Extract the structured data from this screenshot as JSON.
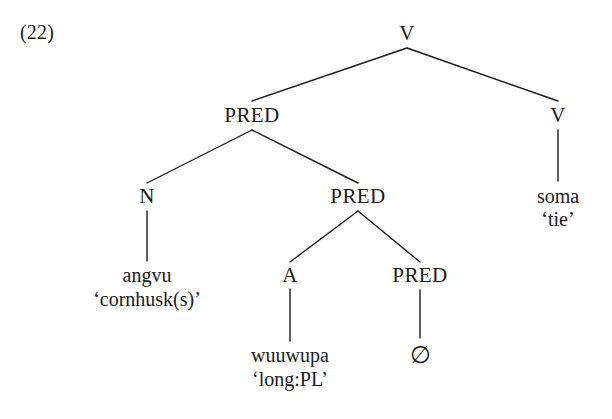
{
  "figure": {
    "example_number": "(22)",
    "ink_color": "#1a1a1a",
    "background_color": "#ffffff"
  },
  "tree": {
    "nodes": {
      "root_v": {
        "label": "V",
        "x": 407,
        "y": 33
      },
      "pred_1": {
        "label": "PRED",
        "x": 252,
        "y": 115
      },
      "v_right": {
        "label": "V",
        "x": 558,
        "y": 115
      },
      "n_1": {
        "label": "N",
        "x": 147,
        "y": 196
      },
      "pred_2": {
        "label": "PRED",
        "x": 358,
        "y": 196
      },
      "a_1": {
        "label": "A",
        "x": 290,
        "y": 275
      },
      "pred_3": {
        "label": "PRED",
        "x": 420,
        "y": 275
      }
    },
    "leaves": {
      "angvu": {
        "form": "angvu",
        "gloss": "‘cornhusk(s)’",
        "x": 147,
        "y": 275,
        "gloss_y": 299
      },
      "soma": {
        "form": "soma",
        "gloss": "‘tie’",
        "x": 558,
        "y": 196,
        "gloss_y": 219
      },
      "wuuwupa": {
        "form": "wuuwupa",
        "gloss": "‘long:PL’",
        "x": 290,
        "y": 355,
        "gloss_y": 379
      },
      "zero": {
        "form": "∅",
        "x": 420,
        "y": 355
      }
    },
    "edges": [
      {
        "from": "root_v",
        "to": "pred_1",
        "x1": 407,
        "y1": 48,
        "x2": 252,
        "y2": 101
      },
      {
        "from": "root_v",
        "to": "v_right",
        "x1": 407,
        "y1": 48,
        "x2": 558,
        "y2": 101
      },
      {
        "from": "pred_1",
        "to": "n_1",
        "x1": 252,
        "y1": 130,
        "x2": 147,
        "y2": 183
      },
      {
        "from": "pred_1",
        "to": "pred_2",
        "x1": 252,
        "y1": 130,
        "x2": 358,
        "y2": 183
      },
      {
        "from": "pred_2",
        "to": "a_1",
        "x1": 358,
        "y1": 211,
        "x2": 290,
        "y2": 262
      },
      {
        "from": "pred_2",
        "to": "pred_3",
        "x1": 358,
        "y1": 211,
        "x2": 420,
        "y2": 262
      },
      {
        "from": "n_1",
        "to": "angvu",
        "x1": 147,
        "y1": 211,
        "x2": 147,
        "y2": 261
      },
      {
        "from": "v_right",
        "to": "soma",
        "x1": 558,
        "y1": 130,
        "x2": 558,
        "y2": 181
      },
      {
        "from": "a_1",
        "to": "wuuwupa",
        "x1": 290,
        "y1": 289,
        "x2": 290,
        "y2": 341
      },
      {
        "from": "pred_3",
        "to": "zero",
        "x1": 420,
        "y1": 290,
        "x2": 420,
        "y2": 338
      }
    ]
  }
}
